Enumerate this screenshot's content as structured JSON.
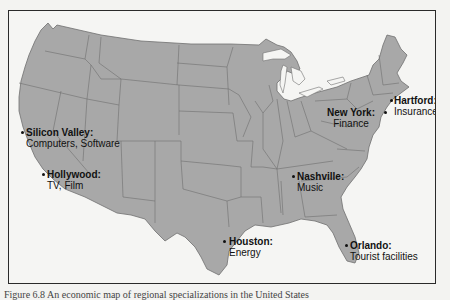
{
  "map": {
    "title": "United States industry centers",
    "colors": {
      "land": "#a8a8a8",
      "borders": "#6e6e6e",
      "background": "#f5f5f3",
      "text": "#111111"
    },
    "locations": [
      {
        "city": "Silicon Valley:",
        "industry": "Computers, Software"
      },
      {
        "city": "Hollywood:",
        "industry": "TV, Film"
      },
      {
        "city": "Houston:",
        "industry": "Energy"
      },
      {
        "city": "Nashville:",
        "industry": "Music"
      },
      {
        "city": "Orlando:",
        "industry": "Tourist facilities"
      },
      {
        "city": "New York:",
        "industry": "Finance"
      },
      {
        "city": "Hartford:",
        "industry": "Insurance"
      }
    ]
  },
  "caption": "Figure 6.8  An economic map of regional specializations in the United States"
}
